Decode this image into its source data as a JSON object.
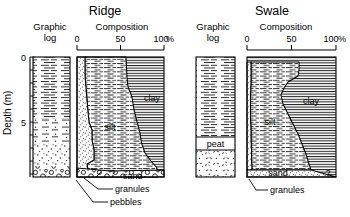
{
  "figure": {
    "y_axis_label": "Depth (m)",
    "y_ticks": [
      "0",
      "5"
    ],
    "y_tick_values": [
      0,
      5
    ],
    "y_minor_step_m": 1,
    "depth_range_m": [
      0,
      9.2
    ]
  },
  "panels": [
    {
      "id": "ridge",
      "title": "Ridge",
      "graphic_log_header": [
        "Graphic",
        "log"
      ],
      "composition_header": "Composition",
      "x_ticks": [
        "0",
        "50",
        "100"
      ],
      "x_tick_values": [
        0,
        50,
        100
      ],
      "x_unit": "%",
      "series_labels": [
        "sand",
        "silt",
        "clay"
      ],
      "callouts": [
        "sand",
        "granules",
        "pebbles"
      ],
      "sand_percent_by_depth": [
        {
          "depth_m": 0.0,
          "value": 9
        },
        {
          "depth_m": 0.8,
          "value": 8
        },
        {
          "depth_m": 1.6,
          "value": 9
        },
        {
          "depth_m": 2.4,
          "value": 11
        },
        {
          "depth_m": 3.2,
          "value": 14
        },
        {
          "depth_m": 4.0,
          "value": 16
        },
        {
          "depth_m": 5.0,
          "value": 17
        },
        {
          "depth_m": 6.0,
          "value": 18
        },
        {
          "depth_m": 6.8,
          "value": 20
        },
        {
          "depth_m": 7.2,
          "value": 13
        },
        {
          "depth_m": 8.0,
          "value": 12
        },
        {
          "depth_m": 8.6,
          "value": 14
        }
      ],
      "silt_cum_percent_by_depth": [
        {
          "depth_m": 0.0,
          "value": 56
        },
        {
          "depth_m": 0.8,
          "value": 57
        },
        {
          "depth_m": 1.6,
          "value": 58
        },
        {
          "depth_m": 2.4,
          "value": 59
        },
        {
          "depth_m": 3.2,
          "value": 64
        },
        {
          "depth_m": 4.0,
          "value": 66
        },
        {
          "depth_m": 5.0,
          "value": 70
        },
        {
          "depth_m": 6.0,
          "value": 74
        },
        {
          "depth_m": 6.8,
          "value": 76
        },
        {
          "depth_m": 7.6,
          "value": 80
        },
        {
          "depth_m": 8.2,
          "value": 86
        },
        {
          "depth_m": 8.6,
          "value": 92
        }
      ],
      "log_units": [
        {
          "name": "mud",
          "top_m": 0.0,
          "base_m": 4.6,
          "pattern": "dashes"
        },
        {
          "name": "sandy-mud",
          "top_m": 4.6,
          "base_m": 6.4,
          "pattern": "dashes-dots"
        },
        {
          "name": "sand",
          "top_m": 6.4,
          "base_m": 8.4,
          "pattern": "dots"
        },
        {
          "name": "gravel",
          "top_m": 8.4,
          "base_m": 9.2,
          "pattern": "pebbles"
        }
      ]
    },
    {
      "id": "swale",
      "title": "Swale",
      "graphic_log_header": [
        "Graphic",
        "log"
      ],
      "composition_header": "Composition",
      "x_ticks": [
        "0",
        "50",
        "100"
      ],
      "x_tick_values": [
        0,
        50,
        100
      ],
      "x_unit": "%",
      "series_labels": [
        "sand",
        "silt",
        "clay"
      ],
      "callouts": [
        "sand",
        "granules"
      ],
      "log_labels": [
        "peat"
      ],
      "sand_percent_by_depth": [
        {
          "depth_m": 0.0,
          "value": 4
        },
        {
          "depth_m": 1.0,
          "value": 4
        },
        {
          "depth_m": 2.0,
          "value": 5
        },
        {
          "depth_m": 3.0,
          "value": 5
        },
        {
          "depth_m": 4.0,
          "value": 5
        },
        {
          "depth_m": 5.0,
          "value": 5
        },
        {
          "depth_m": 6.0,
          "value": 5
        },
        {
          "depth_m": 6.6,
          "value": 6
        },
        {
          "depth_m": 7.0,
          "value": 7
        }
      ],
      "silt_cum_percent_by_depth": [
        {
          "depth_m": 0.0,
          "value": 58
        },
        {
          "depth_m": 0.7,
          "value": 57
        },
        {
          "depth_m": 1.4,
          "value": 47
        },
        {
          "depth_m": 1.9,
          "value": 38
        },
        {
          "depth_m": 2.6,
          "value": 44
        },
        {
          "depth_m": 3.4,
          "value": 50
        },
        {
          "depth_m": 4.2,
          "value": 56
        },
        {
          "depth_m": 5.2,
          "value": 62
        },
        {
          "depth_m": 6.0,
          "value": 66
        },
        {
          "depth_m": 6.6,
          "value": 74
        },
        {
          "depth_m": 7.0,
          "value": 96
        }
      ],
      "log_units": [
        {
          "name": "mud",
          "top_m": 0.0,
          "base_m": 6.2,
          "pattern": "dashes"
        },
        {
          "name": "peat",
          "top_m": 6.2,
          "base_m": 7.0,
          "pattern": "peat-box"
        },
        {
          "name": "sand",
          "top_m": 7.0,
          "base_m": 9.2,
          "pattern": "dots-dashed"
        }
      ]
    }
  ],
  "annotations": {
    "query_marks": [
      "?",
      "?"
    ]
  },
  "colors": {
    "ink": "#000000",
    "paper": "#ffffff",
    "stipple": "#9a9a9a",
    "hatch": "#3a3a3a"
  }
}
